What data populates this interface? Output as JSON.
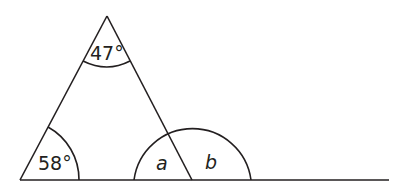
{
  "diagram": {
    "type": "triangle-angles",
    "line_color": "#231f20",
    "labels": {
      "apex_angle": "47°",
      "left_angle": "58°",
      "interior_angle": "a",
      "exterior_angle": "b"
    }
  }
}
